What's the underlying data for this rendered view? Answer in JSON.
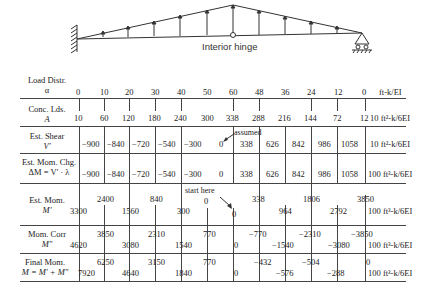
{
  "diagram": {
    "hinge_label": "Interior hinge"
  },
  "rows": {
    "load": {
      "label1": "Load Distr.",
      "label2": "α",
      "unit": "ft-k/EI",
      "values": [
        "0",
        "10",
        "20",
        "30",
        "40",
        "50",
        "60",
        "48",
        "36",
        "24",
        "12",
        "0"
      ]
    },
    "conc": {
      "label1": "Conc. Lds.",
      "label2": "A",
      "unit": "10 ft²-k/6EI",
      "values": [
        "10",
        "60",
        "120",
        "180",
        "240",
        "300",
        "338",
        "288",
        "216",
        "144",
        "72",
        "12"
      ]
    },
    "shear": {
      "label1": "Est. Shear",
      "label2": "V'",
      "unit": "10 ft²-k/6EI",
      "values": [
        "−900",
        "−840",
        "−720",
        "−540",
        "−300",
        "0",
        "338",
        "626",
        "842",
        "986",
        "1058"
      ],
      "annotation": "assumed"
    },
    "momchg": {
      "label1": "Est. Mom. Chg.",
      "label2": "ΔM = V' · λ",
      "unit": "100 ft³-k/6EI",
      "values": [
        "−900",
        "−840",
        "−720",
        "−540",
        "−300",
        "0",
        "338",
        "626",
        "842",
        "986",
        "1058"
      ]
    },
    "estmom": {
      "label1": "Est. Mom.",
      "label2": "M'",
      "unit": "100 ft³-k/6EI",
      "upper": [
        "2400",
        "840",
        "0",
        "338",
        "1806",
        "3850"
      ],
      "lower": [
        "3300",
        "1560",
        "300",
        "0",
        "964",
        "2792"
      ],
      "annotation": "start here"
    },
    "momcorr": {
      "label1": "Mom. Corr",
      "label2": "M\"",
      "unit": "100 ft³-k/6EI",
      "upper": [
        "3850",
        "2310",
        "770",
        "−770",
        "−2310",
        "−3850"
      ],
      "lower": [
        "4620",
        "3080",
        "1540",
        "0",
        "−1540",
        "−3080"
      ]
    },
    "final": {
      "label1": "Final Mom.",
      "label2": "M = M' + M\"",
      "unit": "100 ft³-k/6EI",
      "upper": [
        "6250",
        "3150",
        "770",
        "−432",
        "−504",
        "0"
      ],
      "lower": [
        "7920",
        "4640",
        "1840",
        "0",
        "−576",
        "−288"
      ]
    }
  }
}
